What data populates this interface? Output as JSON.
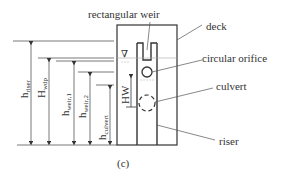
{
  "figure": {
    "caption": "(c)",
    "labels": {
      "rectangular_weir": "rectangular weir",
      "deck": "deck",
      "circular_orifice": "circular orifice",
      "culvert": "culvert",
      "riser": "riser"
    },
    "dimensions": {
      "h_riser": {
        "main": "h",
        "sub": "riser"
      },
      "H_wdp": {
        "main": "H",
        "sub": "wdp"
      },
      "h_weir1": {
        "main": "h",
        "sub": "weir,1"
      },
      "h_weir2": {
        "main": "h",
        "sub": "weir,2"
      },
      "h_culvert": {
        "main": "h",
        "sub": "culvert"
      },
      "HW": {
        "main": "HW",
        "sub": ""
      }
    },
    "water_level_symbol": "∇"
  },
  "colors": {
    "line": "#333333",
    "dim_line": "#555555",
    "text": "#333333"
  }
}
